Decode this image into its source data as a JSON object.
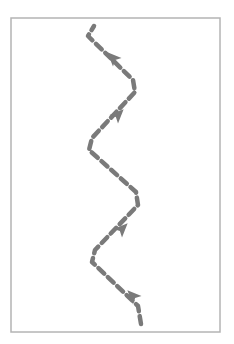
{
  "diagram": {
    "type": "path-trajectory",
    "frame": {
      "x": 11,
      "y": 18,
      "width": 209,
      "height": 314,
      "stroke": "#b4b4b4",
      "stroke_width": 1.5
    },
    "path": {
      "stroke": "#7a7a7a",
      "stroke_width": 4.5,
      "dash": "8 5",
      "direction": "bottom-to-top",
      "points": [
        [
          141,
          324
        ],
        [
          138,
          306
        ],
        [
          92,
          262
        ],
        [
          95,
          250
        ],
        [
          138,
          205
        ],
        [
          136,
          192
        ],
        [
          89,
          150
        ],
        [
          92,
          138
        ],
        [
          135,
          92
        ],
        [
          133,
          80
        ],
        [
          88,
          36
        ],
        [
          94,
          26
        ]
      ]
    },
    "arrows": [
      {
        "x": 133,
        "y": 296,
        "angle": -135
      },
      {
        "x": 122,
        "y": 229,
        "angle": -45
      },
      {
        "x": 118,
        "y": 115,
        "angle": -45
      },
      {
        "x": 113,
        "y": 58,
        "angle": -135
      }
    ],
    "arrow_color": "#7a7a7a"
  }
}
